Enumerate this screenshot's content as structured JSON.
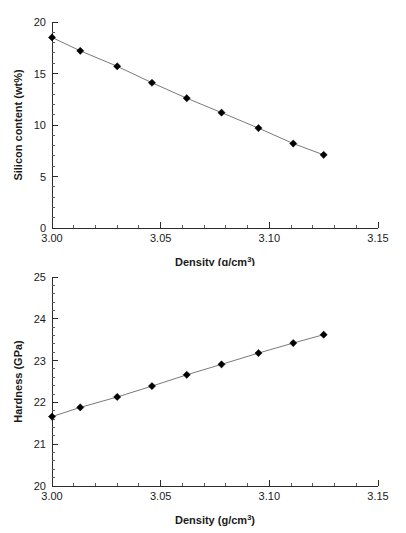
{
  "figure": {
    "background": "#ffffff",
    "marker_color": "#000000",
    "line_color": "#7a7a7a",
    "axis_color": "#2b2b2b"
  },
  "chart_data": [
    {
      "id": "silicon-content-vs-density",
      "type": "line",
      "title": "",
      "xlabel": "Density (g/cm",
      "xlabel_sup": "3",
      "xlabel_tail": ")",
      "ylabel": "Silicon content (wt%)",
      "xlim": [
        3.0,
        3.15
      ],
      "ylim": [
        0,
        20
      ],
      "xticks": [
        3.0,
        3.05,
        3.1,
        3.15
      ],
      "xticklabels": [
        "3.00",
        "3.05",
        "3.10",
        "3.15"
      ],
      "yticks": [
        0,
        5,
        10,
        15,
        20
      ],
      "yticklabels": [
        "0",
        "5",
        "10",
        "15",
        "20"
      ],
      "x_minor_step": 0.01,
      "y_minor_step": 1,
      "grid": false,
      "legend": "none",
      "marker": "diamond",
      "x": [
        3.0,
        3.013,
        3.03,
        3.046,
        3.062,
        3.078,
        3.095,
        3.111,
        3.125
      ],
      "values": [
        18.5,
        17.2,
        15.7,
        14.1,
        12.6,
        11.2,
        9.7,
        8.2,
        7.1
      ]
    },
    {
      "id": "hardness-vs-density",
      "type": "line",
      "title": "",
      "xlabel": "Density (g/cm",
      "xlabel_sup": "3",
      "xlabel_tail": ")",
      "ylabel": "Hardness (GPa)",
      "xlim": [
        3.0,
        3.15
      ],
      "ylim": [
        20,
        25
      ],
      "xticks": [
        3.0,
        3.05,
        3.1,
        3.15
      ],
      "xticklabels": [
        "3.00",
        "3.05",
        "3.10",
        "3.15"
      ],
      "yticks": [
        20,
        21,
        22,
        23,
        24,
        25
      ],
      "yticklabels": [
        "20",
        "21",
        "22",
        "23",
        "24",
        "25"
      ],
      "x_minor_step": 0.01,
      "y_minor_step": 0.2,
      "grid": false,
      "legend": "none",
      "marker": "diamond",
      "x": [
        3.0,
        3.013,
        3.03,
        3.046,
        3.062,
        3.078,
        3.095,
        3.111,
        3.125
      ],
      "values": [
        21.66,
        21.88,
        22.13,
        22.39,
        22.66,
        22.91,
        23.18,
        23.42,
        23.62
      ]
    }
  ]
}
